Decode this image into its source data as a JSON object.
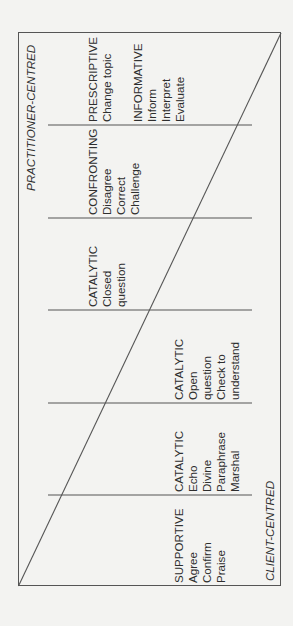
{
  "diagram": {
    "axis_top": "PRACTITIONER-CENTRED",
    "axis_bottom": "CLIENT-CENTRED",
    "cells": [
      {
        "groups": [
          {
            "title": "PRESCRIPTIVE",
            "items": [
              "Change topic"
            ]
          },
          {
            "title": "INFORMATIVE",
            "items": [
              "Inform",
              "Interpret",
              "Evaluate"
            ]
          }
        ]
      },
      {
        "groups": [
          {
            "title": "CONFRONTING",
            "items": [
              "Disagree",
              "Correct",
              "Challenge"
            ]
          }
        ]
      },
      {
        "groups": [
          {
            "title": "CATALYTIC",
            "items": [
              "Closed",
              "question"
            ]
          }
        ]
      },
      {
        "groups": [
          {
            "title": "CATALYTIC",
            "items": [
              "Open",
              "question",
              "Check to",
              "understand"
            ]
          }
        ]
      },
      {
        "groups": [
          {
            "title": "CATALYTIC",
            "items": [
              "Echo",
              "Divine",
              "Paraphrase",
              "Marshal"
            ]
          }
        ]
      },
      {
        "groups": [
          {
            "title": "SUPPORTIVE",
            "items": [
              "Agree",
              "Confirm",
              "Praise"
            ]
          }
        ]
      }
    ],
    "colors": {
      "background": "#f3f3f1",
      "line": "#555555",
      "text": "#2e2e2e"
    }
  }
}
